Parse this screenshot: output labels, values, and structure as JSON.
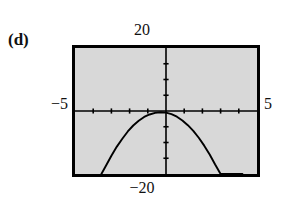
{
  "figure": {
    "part_label": "(d)",
    "labels": {
      "ymax": "20",
      "ymin": "−20",
      "xmin": "−5",
      "xmax": "5"
    }
  },
  "chart_data": {
    "type": "line",
    "title": "(d)",
    "xlabel": "",
    "ylabel": "",
    "xlim": [
      -5,
      5
    ],
    "ylim": [
      -20,
      20
    ],
    "grid": false,
    "legend": "none",
    "background": "#d8d8d8",
    "border_color": "#000000",
    "curve_color": "#000000",
    "axis_color": "#000000",
    "x_tick_values": [
      -4,
      -3,
      -2,
      -1,
      1,
      2,
      3,
      4
    ],
    "y_tick_values": [
      -15,
      -10,
      -5,
      5,
      10,
      15
    ],
    "tick_step_x": 1,
    "tick_step_y": 5,
    "annotations": [
      "ymax label 20 above screen",
      "ymin label -20 below screen",
      "xmin label -5 left of screen",
      "xmax label 5 right of screen"
    ],
    "series": [
      {
        "name": "downward parabola",
        "description": "Downward-opening parabola with vertex just below the origin; crosses the bottom of the window near x = -3.5 and x = 4.2",
        "vertex": [
          -0.2,
          -1.2
        ],
        "x": [
          -3.55,
          -3.3,
          -3.0,
          -2.7,
          -2.4,
          -2.1,
          -1.8,
          -1.5,
          -1.2,
          -0.9,
          -0.6,
          -0.3,
          0.0,
          0.3,
          0.6,
          0.9,
          1.2,
          1.5,
          1.8,
          2.1,
          2.4,
          2.7,
          3.0,
          3.3,
          3.6,
          3.9,
          4.2
        ],
        "y": [
          -20.0,
          -17.4,
          -14.2,
          -11.3,
          -8.8,
          -6.5,
          -4.6,
          -3.1,
          -1.9,
          -1.1,
          -0.6,
          -0.4,
          -0.5,
          -1.0,
          -1.8,
          -3.0,
          -4.5,
          -6.3,
          -8.5,
          -11.0,
          -13.8,
          -17.0,
          -20.0,
          -20.0,
          -20.0,
          -20.0,
          -20.0
        ]
      }
    ]
  }
}
